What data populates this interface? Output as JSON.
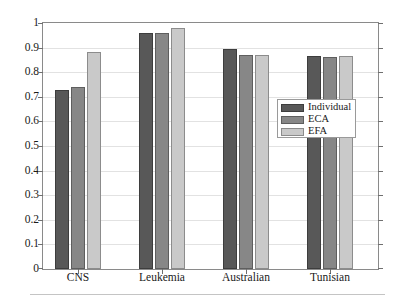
{
  "chart_data": {
    "type": "bar",
    "title": "",
    "subtitle": "",
    "xlabel": "",
    "ylabel": "",
    "categories": [
      "CNS",
      "Leukemia",
      "Australian",
      "Tunisian"
    ],
    "series": [
      {
        "name": "Individual",
        "color": "#585858",
        "values": [
          0.727,
          0.96,
          0.895,
          0.867
        ]
      },
      {
        "name": "ECA",
        "color": "#878787",
        "values": [
          0.741,
          0.96,
          0.869,
          0.863
        ]
      },
      {
        "name": "EFA",
        "color": "#c9c9c9",
        "values": [
          0.881,
          0.981,
          0.872,
          0.864
        ]
      }
    ],
    "ylim": [
      0,
      1
    ],
    "yticks": [
      0,
      0.1,
      0.2,
      0.3,
      0.4,
      0.5,
      0.6,
      0.7,
      0.8,
      0.9,
      1
    ],
    "ytick_labels": [
      "0",
      "0.1",
      "0.2",
      "0.3",
      "0.4",
      "0.5",
      "0.6",
      "0.7",
      "0.8",
      "0.9",
      "1"
    ],
    "grid": true,
    "legend": {
      "position": "center-right",
      "entries": [
        "Individual",
        "ECA",
        "EFA"
      ]
    }
  },
  "legend": {
    "items": [
      {
        "label": "Individual"
      },
      {
        "label": "ECA"
      },
      {
        "label": "EFA"
      }
    ]
  },
  "axes": {
    "y_labels": [
      "1",
      "0.9",
      "0.8",
      "0.7",
      "0.6",
      "0.5",
      "0.4",
      "0.3",
      "0.2",
      "0.1",
      "0"
    ],
    "x_labels": [
      "CNS",
      "Leukemia",
      "Australian",
      "Tunisian"
    ]
  }
}
